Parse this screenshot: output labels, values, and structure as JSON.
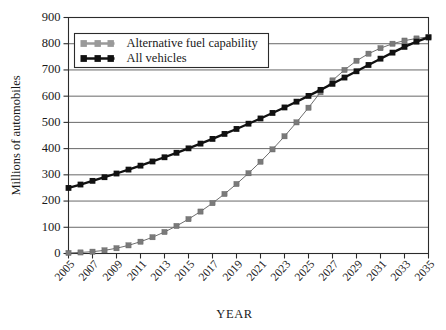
{
  "chart_data": {
    "type": "line",
    "title": "",
    "xlabel": "YEAR",
    "ylabel": "Millions of automobiles",
    "xlim": [
      2005,
      2035
    ],
    "ylim": [
      0,
      900
    ],
    "ytick_step": 100,
    "xtick_step": 2,
    "grid": "horizontal",
    "legend_position": "top-left",
    "yticks": [
      0,
      100,
      200,
      300,
      400,
      500,
      600,
      700,
      800,
      900
    ],
    "ytick_labels": [
      "0",
      "100",
      "200",
      "300",
      "400",
      "500",
      "600",
      "700",
      "800",
      "900"
    ],
    "xticks": [
      2005,
      2007,
      2009,
      2011,
      2013,
      2015,
      2017,
      2019,
      2021,
      2023,
      2025,
      2027,
      2029,
      2031,
      2033,
      2035
    ],
    "xtick_labels": [
      "2005",
      "2007",
      "2009",
      "2011",
      "2013",
      "2015",
      "2017",
      "2019",
      "2021",
      "2023",
      "2025",
      "2027",
      "2029",
      "2031",
      "2033",
      "2035"
    ],
    "x": [
      2005,
      2006,
      2007,
      2008,
      2009,
      2010,
      2011,
      2012,
      2013,
      2014,
      2015,
      2016,
      2017,
      2018,
      2019,
      2020,
      2021,
      2022,
      2023,
      2024,
      2025,
      2026,
      2027,
      2028,
      2029,
      2030,
      2031,
      2032,
      2033,
      2034,
      2035
    ],
    "series": [
      {
        "name": "Alternative fuel capability",
        "color": "#7a7a7a",
        "marker": "square",
        "values": [
          2,
          4,
          7,
          12,
          20,
          31,
          45,
          62,
          82,
          105,
          131,
          160,
          192,
          227,
          265,
          306,
          350,
          397,
          447,
          500,
          556,
          615,
          660,
          700,
          735,
          762,
          783,
          800,
          812,
          820,
          826
        ]
      },
      {
        "name": "All vehicles",
        "color": "#111111",
        "marker": "square",
        "values": [
          250,
          263,
          277,
          291,
          305,
          320,
          335,
          351,
          367,
          384,
          401,
          419,
          437,
          456,
          475,
          495,
          515,
          536,
          557,
          579,
          601,
          624,
          647,
          671,
          695,
          719,
          743,
          766,
          788,
          808,
          824
        ]
      }
    ]
  },
  "legend": {
    "items": [
      {
        "label": "Alternative fuel capability",
        "color": "#9a9a9a"
      },
      {
        "label": "All vehicles",
        "color": "#111111"
      }
    ]
  },
  "axes": {
    "x_title": "YEAR",
    "y_title": "Millions of automobiles"
  }
}
